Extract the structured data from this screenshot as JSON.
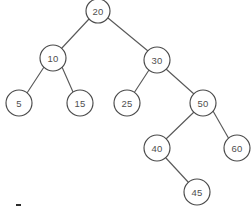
{
  "diagram": {
    "type": "binary-search-tree",
    "background_color": "#ffffff",
    "node_fill_color": "#ffffff",
    "node_stroke_color": "#4a4a4a",
    "edge_color": "#5a5a5a",
    "label_color": "#4f4f4f",
    "nodes": [
      {
        "id": "n20",
        "label": "20",
        "cx": 98,
        "cy": 11,
        "r": 12
      },
      {
        "id": "n10",
        "label": "10",
        "cx": 53,
        "cy": 58,
        "r": 13
      },
      {
        "id": "n30",
        "label": "30",
        "cx": 157,
        "cy": 60,
        "r": 13
      },
      {
        "id": "n5",
        "label": "5",
        "cx": 19,
        "cy": 103,
        "r": 13
      },
      {
        "id": "n15",
        "label": "15",
        "cx": 80,
        "cy": 103,
        "r": 13
      },
      {
        "id": "n25",
        "label": "25",
        "cx": 127,
        "cy": 103,
        "r": 13
      },
      {
        "id": "n50",
        "label": "50",
        "cx": 203,
        "cy": 103,
        "r": 13
      },
      {
        "id": "n40",
        "label": "40",
        "cx": 157,
        "cy": 148,
        "r": 13
      },
      {
        "id": "n60",
        "label": "60",
        "cx": 237,
        "cy": 148,
        "r": 13
      },
      {
        "id": "n45",
        "label": "45",
        "cx": 197,
        "cy": 192,
        "r": 13
      }
    ],
    "edges": [
      {
        "from": "n20",
        "to": "n10",
        "x1": 89,
        "y1": 19,
        "x2": 61,
        "y2": 49
      },
      {
        "from": "n20",
        "to": "n30",
        "x1": 108,
        "y1": 18,
        "x2": 148,
        "y2": 51
      },
      {
        "from": "n10",
        "to": "n5",
        "x1": 44,
        "y1": 67,
        "x2": 27,
        "y2": 93
      },
      {
        "from": "n10",
        "to": "n15",
        "x1": 62,
        "y1": 67,
        "x2": 73,
        "y2": 92
      },
      {
        "from": "n30",
        "to": "n25",
        "x1": 149,
        "y1": 70,
        "x2": 134,
        "y2": 93
      },
      {
        "from": "n30",
        "to": "n50",
        "x1": 166,
        "y1": 69,
        "x2": 194,
        "y2": 94
      },
      {
        "from": "n50",
        "to": "n40",
        "x1": 194,
        "y1": 112,
        "x2": 166,
        "y2": 139
      },
      {
        "from": "n50",
        "to": "n60",
        "x1": 213,
        "y1": 111,
        "x2": 229,
        "y2": 139
      },
      {
        "from": "n40",
        "to": "n45",
        "x1": 165,
        "y1": 157,
        "x2": 189,
        "y2": 183
      }
    ],
    "stray_mark": {
      "x": 16,
      "y": 204,
      "width": 5,
      "height": 2
    }
  }
}
